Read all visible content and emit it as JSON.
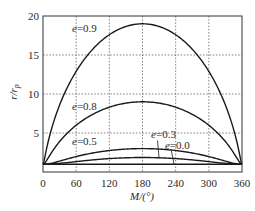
{
  "chart_data": {
    "type": "line",
    "title": "",
    "xlabel": "M/(°)",
    "ylabel": "r/r_p",
    "xlim": [
      0,
      360
    ],
    "ylim": [
      0,
      20
    ],
    "x_ticks": [
      "0",
      "60",
      "120",
      "180",
      "240",
      "300",
      "360"
    ],
    "y_ticks": [
      "5",
      "10",
      "15",
      "20"
    ],
    "grid": true,
    "legend": "inline labels",
    "series": [
      {
        "name": "e=0.9",
        "e": 0.9,
        "peak": {
          "x": 180,
          "y": 19.0
        },
        "label_pos": {
          "x": 75,
          "y": 17.9
        }
      },
      {
        "name": "e=0.8",
        "e": 0.8,
        "peak": {
          "x": 180,
          "y": 9.0
        },
        "label_pos": {
          "x": 75,
          "y": 7.9
        }
      },
      {
        "name": "e=0.5",
        "e": 0.5,
        "peak": {
          "x": 180,
          "y": 3.0
        },
        "label_pos": {
          "x": 75,
          "y": 3.4
        }
      },
      {
        "name": "e=0.3",
        "e": 0.3,
        "peak": {
          "x": 180,
          "y": 1.86
        },
        "label_pos": {
          "x": 218,
          "y": 4.3
        },
        "leader_to": {
          "x": 210,
          "y": 1.8
        }
      },
      {
        "name": "e=0.0",
        "e": 0.0,
        "peak": {
          "x": 180,
          "y": 1.0
        },
        "label_pos": {
          "x": 243,
          "y": 3.0
        },
        "leader_to": {
          "x": 237,
          "y": 1.0
        }
      }
    ],
    "values_sampled": {
      "x": [
        0,
        60,
        120,
        180,
        240,
        300,
        360
      ],
      "e=0.9": [
        1.0,
        12.6,
        18.1,
        19.0,
        18.1,
        12.6,
        1.0
      ],
      "e=0.8": [
        1.0,
        6.8,
        8.6,
        9.0,
        8.6,
        6.8,
        1.0
      ],
      "e=0.5": [
        1.0,
        2.45,
        2.9,
        3.0,
        2.9,
        2.45,
        1.0
      ],
      "e=0.3": [
        1.0,
        1.6,
        1.82,
        1.86,
        1.82,
        1.6,
        1.0
      ],
      "e=0.0": [
        1.0,
        1.0,
        1.0,
        1.0,
        1.0,
        1.0,
        1.0
      ]
    }
  }
}
